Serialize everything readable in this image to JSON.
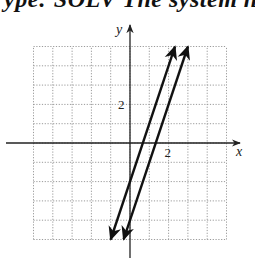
{
  "header": {
    "clipped_text": "ype: SOLV   The system h"
  },
  "chart_data": {
    "type": "line",
    "title": "",
    "xlabel": "x",
    "ylabel": "y",
    "xlim": [
      -5,
      5
    ],
    "ylim": [
      -5,
      5
    ],
    "grid": true,
    "grid_style": "dotted",
    "tick_labels": {
      "x": [
        {
          "value": 2,
          "label": "2"
        }
      ],
      "y": [
        {
          "value": 2,
          "label": "2"
        }
      ]
    },
    "series": [
      {
        "name": "line-1",
        "equation": "y = 3x - 2",
        "slope": 3,
        "intercept": -2,
        "x_range": [
          -1,
          2.33
        ],
        "arrows": "both"
      },
      {
        "name": "line-2",
        "equation": "y = 3x - 4",
        "slope": 3,
        "intercept": -4,
        "x_range": [
          -0.33,
          3.0
        ],
        "arrows": "both"
      }
    ]
  },
  "layout": {
    "origin_px": [
      130,
      143
    ],
    "unit_px": 19.3,
    "colors": {
      "axis": "#222222",
      "grid": "#9a9a9a",
      "line": "#111111"
    }
  }
}
